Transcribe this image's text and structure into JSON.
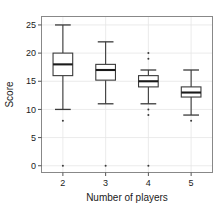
{
  "chart_data": {
    "type": "box",
    "title": "",
    "xlabel": "Number of players",
    "ylabel": "Score",
    "categories": [
      "2",
      "3",
      "4",
      "5"
    ],
    "xtick_labels": [
      "2",
      "3",
      "4",
      "5"
    ],
    "ytick_labels": [
      "0",
      "5",
      "10",
      "15",
      "20",
      "25"
    ],
    "ytick_values": [
      0,
      5,
      10,
      15,
      20,
      25
    ],
    "ylim": [
      -1.2,
      26.5
    ],
    "grid": true,
    "legend": null,
    "boxes": [
      {
        "category": "2",
        "whisker_low": 10,
        "q1": 16,
        "median": 18,
        "q3": 20,
        "whisker_high": 25,
        "outliers": [
          8,
          0
        ]
      },
      {
        "category": "3",
        "whisker_low": 11,
        "q1": 15.2,
        "median": 17,
        "q3": 18,
        "whisker_high": 22,
        "outliers": [
          0
        ]
      },
      {
        "category": "4",
        "whisker_low": 11,
        "q1": 14,
        "median": 15,
        "q3": 16,
        "whisker_high": 17,
        "outliers": [
          20,
          19,
          10,
          9,
          0
        ]
      },
      {
        "category": "5",
        "whisker_low": 9,
        "q1": 12.2,
        "median": 13,
        "q3": 14,
        "whisker_high": 17,
        "outliers": [
          8
        ]
      }
    ]
  },
  "colors": {
    "background": "#ffffff",
    "frame": "#888888",
    "grid": "#e6e6e6",
    "box_stroke": "#3a3a3a",
    "median": "#1a1a1a",
    "text": "#1a1a1a"
  }
}
